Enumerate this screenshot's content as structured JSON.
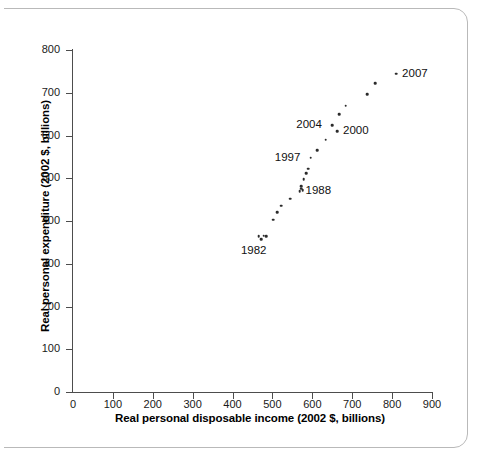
{
  "chart_data": {
    "type": "scatter",
    "title": "",
    "xlabel": "Real personal disposable income (2002 $, billions)",
    "ylabel": "Real personal expenditure (2002 $, billions)",
    "xlim": [
      0,
      900
    ],
    "ylim": [
      0,
      800
    ],
    "xticks": [
      0,
      100,
      200,
      300,
      400,
      500,
      600,
      700,
      800,
      900
    ],
    "yticks": [
      0,
      100,
      200,
      300,
      400,
      500,
      600,
      700,
      800
    ],
    "xtick_labels": [
      "0",
      "100",
      "200",
      "300",
      "400",
      "500",
      "600",
      "700",
      "800",
      "900"
    ],
    "ytick_labels": [
      "0",
      "100",
      "200",
      "300",
      "400",
      "500",
      "600",
      "700",
      "800"
    ],
    "grid": false,
    "legend": "none",
    "marker": "dot",
    "marker_color": "#2b2b2b",
    "points": [
      {
        "x": 466,
        "y": 364
      },
      {
        "x": 472,
        "y": 358
      },
      {
        "x": 478,
        "y": 366
      },
      {
        "x": 484,
        "y": 365
      },
      {
        "x": 502,
        "y": 403
      },
      {
        "x": 512,
        "y": 420
      },
      {
        "x": 522,
        "y": 436
      },
      {
        "x": 545,
        "y": 452
      },
      {
        "x": 568,
        "y": 470
      },
      {
        "x": 572,
        "y": 476
      },
      {
        "x": 572,
        "y": 482
      },
      {
        "x": 576,
        "y": 472
      },
      {
        "x": 578,
        "y": 498
      },
      {
        "x": 585,
        "y": 512
      },
      {
        "x": 590,
        "y": 522
      },
      {
        "x": 596,
        "y": 548
      },
      {
        "x": 612,
        "y": 566
      },
      {
        "x": 634,
        "y": 590
      },
      {
        "x": 650,
        "y": 624
      },
      {
        "x": 662,
        "y": 610
      },
      {
        "x": 668,
        "y": 650
      },
      {
        "x": 684,
        "y": 670
      },
      {
        "x": 738,
        "y": 696
      },
      {
        "x": 758,
        "y": 722
      },
      {
        "x": 810,
        "y": 745
      }
    ],
    "annotations": [
      {
        "label": "2007",
        "x": 810,
        "y": 745,
        "anchor": "right-of-point"
      },
      {
        "label": "2004",
        "x": 650,
        "y": 624,
        "anchor": "left-of-point"
      },
      {
        "label": "2000",
        "x": 662,
        "y": 610,
        "anchor": "right-of-point"
      },
      {
        "label": "1997",
        "x": 596,
        "y": 548,
        "anchor": "left-of-point"
      },
      {
        "label": "1988",
        "x": 568,
        "y": 470,
        "anchor": "right-of-point"
      },
      {
        "label": "1982",
        "x": 466,
        "y": 364,
        "anchor": "below-point"
      }
    ]
  },
  "axes": {
    "x_title": "Real personal disposable income (2002 $, billions)",
    "y_title": "Real personal expenditure (2002 $, billions)"
  },
  "labels": {
    "y2007": "2007",
    "y2004": "2004",
    "y2000": "2000",
    "y1997": "1997",
    "y1988": "1988",
    "y1982": "1982"
  }
}
